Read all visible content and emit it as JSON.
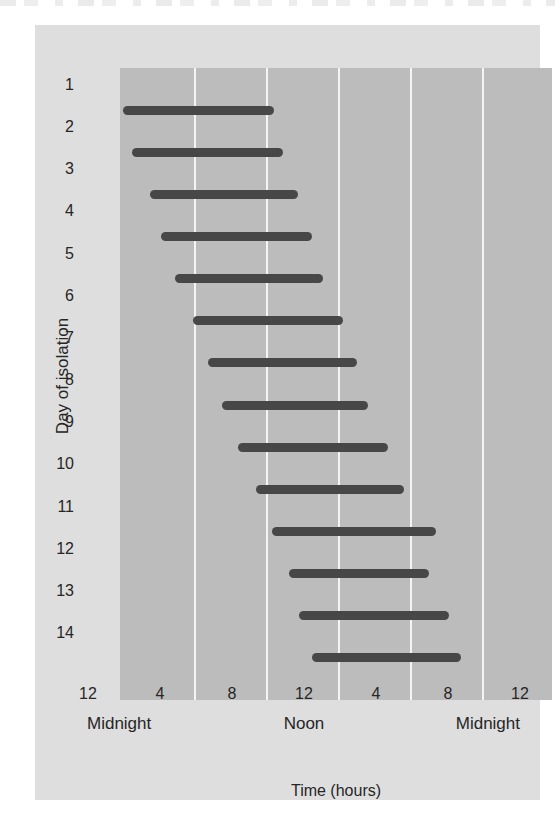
{
  "figure": {
    "colors": {
      "page_bg": "#ffffff",
      "card_bg": "#dedede",
      "plot_bg": "#bcbcbc",
      "gridline": "#f4f4f4",
      "bar": "#474747",
      "text": "#262626"
    }
  },
  "chart_data": {
    "type": "bar",
    "orientation": "horizontal-range",
    "title": "",
    "xlabel": "Time (hours)",
    "ylabel": "Day of isolation",
    "xlim_hours": [
      0,
      24
    ],
    "grid": "vertical white gridlines every 4 hours",
    "legend": "none",
    "categories": [
      "1",
      "2",
      "3",
      "4",
      "5",
      "6",
      "7",
      "8",
      "9",
      "10",
      "11",
      "12",
      "13",
      "14"
    ],
    "bars": [
      {
        "day": 1,
        "start_hour": 0.0,
        "end_hour": 8.4
      },
      {
        "day": 2,
        "start_hour": 0.5,
        "end_hour": 8.9
      },
      {
        "day": 3,
        "start_hour": 1.5,
        "end_hour": 9.7
      },
      {
        "day": 4,
        "start_hour": 2.1,
        "end_hour": 10.5
      },
      {
        "day": 5,
        "start_hour": 2.9,
        "end_hour": 11.1
      },
      {
        "day": 6,
        "start_hour": 3.9,
        "end_hour": 12.2
      },
      {
        "day": 7,
        "start_hour": 4.7,
        "end_hour": 13.0
      },
      {
        "day": 8,
        "start_hour": 5.5,
        "end_hour": 13.6
      },
      {
        "day": 9,
        "start_hour": 6.4,
        "end_hour": 14.7
      },
      {
        "day": 10,
        "start_hour": 7.4,
        "end_hour": 15.6
      },
      {
        "day": 11,
        "start_hour": 8.3,
        "end_hour": 17.4
      },
      {
        "day": 12,
        "start_hour": 9.2,
        "end_hour": 17.0
      },
      {
        "day": 13,
        "start_hour": 9.8,
        "end_hour": 18.1
      },
      {
        "day": 14,
        "start_hour": 10.5,
        "end_hour": 18.8
      }
    ],
    "x_ticks": [
      {
        "hour": 0,
        "label": "12",
        "sublabel": "Midnight",
        "sublabel_align": "left"
      },
      {
        "hour": 4,
        "label": "4"
      },
      {
        "hour": 8,
        "label": "8"
      },
      {
        "hour": 12,
        "label": "12",
        "sublabel": "Noon",
        "sublabel_align": "center"
      },
      {
        "hour": 16,
        "label": "4"
      },
      {
        "hour": 20,
        "label": "8"
      },
      {
        "hour": 24,
        "label": "12",
        "sublabel": "Midnight",
        "sublabel_align": "right"
      }
    ],
    "gridline_hours": [
      4,
      8,
      12,
      16,
      20
    ]
  }
}
